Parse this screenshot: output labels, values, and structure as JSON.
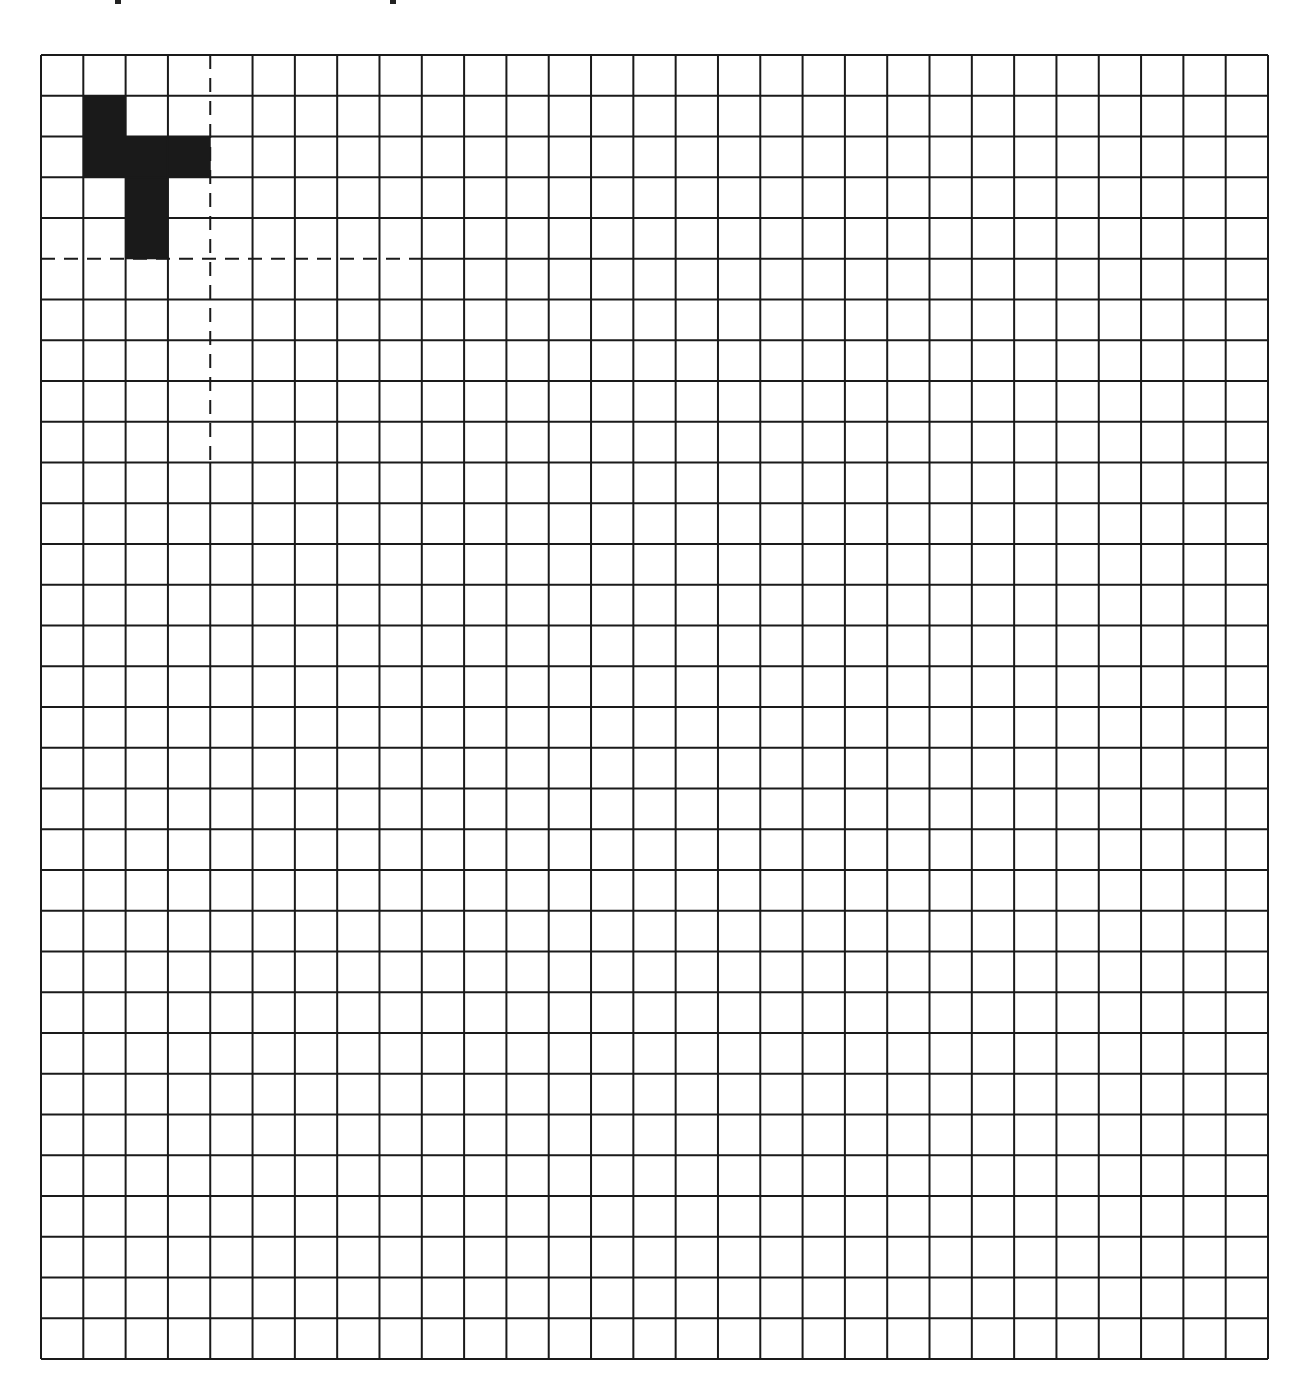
{
  "figure": {
    "caption_fragment_visible": "",
    "caption_clipped": true,
    "grid": {
      "columns": 29,
      "rows": 32,
      "left": 41,
      "top": 55,
      "right": 1268,
      "bottom": 1359,
      "line_color": "#1a1a1a",
      "line_width": 2,
      "background": "#ffffff"
    },
    "shape": {
      "fill_color": "#1a1a1a",
      "cells": [
        {
          "col": 1,
          "row": 1
        },
        {
          "col": 1,
          "row": 2
        },
        {
          "col": 2,
          "row": 2
        },
        {
          "col": 3,
          "row": 2
        },
        {
          "col": 2,
          "row": 3
        },
        {
          "col": 2,
          "row": 4
        }
      ]
    },
    "dashed_lines": [
      {
        "orientation": "horizontal",
        "at_row_boundary": 5,
        "from_col": 0,
        "to_col": 8
      },
      {
        "orientation": "vertical",
        "at_col_boundary": 4,
        "from_row": 0,
        "to_row": 9
      }
    ],
    "top_descender_fragments_x": [
      115,
      390
    ]
  }
}
